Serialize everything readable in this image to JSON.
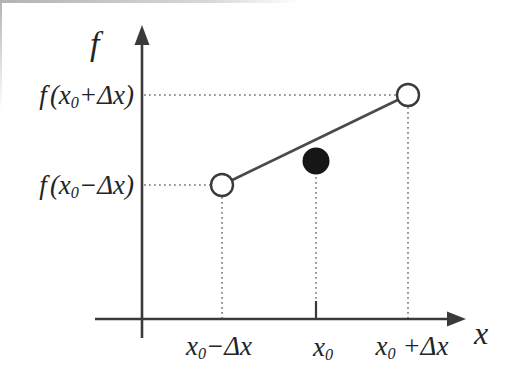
{
  "figure": {
    "colors": {
      "background": "#ffffff",
      "ink": "#3a3a3a",
      "text": "#242424",
      "dotted_guide": "#7a7a7a",
      "filled_point": "#161616",
      "open_point_fill": "#ffffff"
    },
    "labels": {
      "y_axis": "f",
      "x_axis": "x",
      "f_plus": {
        "f": "f",
        "open": "(x",
        "sub": "0",
        "rest": "+Δx)"
      },
      "f_minus": {
        "f": "f",
        "open": "(x",
        "sub": "0",
        "rest": "−Δx)"
      },
      "x_minus": {
        "base": "x",
        "sub": "0",
        "rest": "−Δx"
      },
      "x_center": {
        "base": "x",
        "sub": "0",
        "rest": ""
      },
      "x_plus": {
        "base": "x",
        "sub": "0",
        "rest": " +Δx"
      }
    },
    "geometry": {
      "markers": [
        {
          "at": "x0−Δx",
          "level": "f(x0−Δx)",
          "style": "open-circle"
        },
        {
          "at": "x0",
          "style": "filled-circle"
        },
        {
          "at": "x0+Δx",
          "level": "f(x0+Δx)",
          "style": "open-circle"
        }
      ],
      "secant_line": "straight line joining the two open circles",
      "guides": "dotted lines from each marker to the x and f axes, tick on x axis at x0"
    }
  }
}
